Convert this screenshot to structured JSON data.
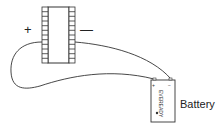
{
  "diagram": {
    "chip": {
      "left_label": "+",
      "right_label": "—",
      "pins_per_side": 12
    },
    "battery": {
      "label": "Battery",
      "brand_text": "EVEREADY",
      "terminal_plus": "+",
      "terminal_minus": "−"
    },
    "colors": {
      "line": "#333333",
      "background": "#ffffff"
    }
  }
}
